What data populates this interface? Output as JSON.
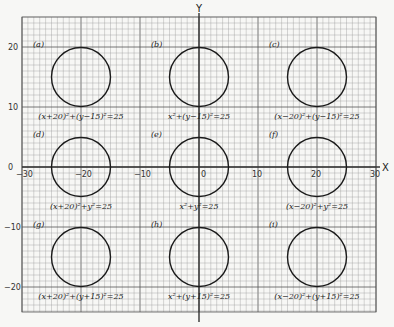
{
  "chart_data": {
    "type": "scatter",
    "title": "",
    "xlabel": "X",
    "ylabel": "Y",
    "xlim": [
      -30,
      30
    ],
    "ylim": [
      -25,
      25
    ],
    "grid": true,
    "x_ticks": [
      "-30",
      "-20",
      "-10",
      "0",
      "10",
      "20",
      "30"
    ],
    "y_ticks": [
      "20",
      "10",
      "0",
      "-10",
      "-20"
    ],
    "circles": [
      {
        "tag": "(a)",
        "cx": -20,
        "cy": 15,
        "r": 5,
        "equation": "(x+20)²+(y−15)²=25"
      },
      {
        "tag": "(b)",
        "cx": 0,
        "cy": 15,
        "r": 5,
        "equation": "x²+(y−15)²=25"
      },
      {
        "tag": "(c)",
        "cx": 20,
        "cy": 15,
        "r": 5,
        "equation": "(x−20)²+(y−15)²=25"
      },
      {
        "tag": "(d)",
        "cx": -20,
        "cy": 0,
        "r": 5,
        "equation": "(x+20)²+y²=25"
      },
      {
        "tag": "(e)",
        "cx": 0,
        "cy": 0,
        "r": 5,
        "equation": "x²+y²=25"
      },
      {
        "tag": "(f)",
        "cx": 20,
        "cy": 0,
        "r": 5,
        "equation": "(x−20)²+y²=25"
      },
      {
        "tag": "(g)",
        "cx": -20,
        "cy": -15,
        "r": 5,
        "equation": "(x+20)²+(y+15)²=25"
      },
      {
        "tag": "(h)",
        "cx": 0,
        "cy": -15,
        "r": 5,
        "equation": "x²+(y+15)²=25"
      },
      {
        "tag": "(i)",
        "cx": 20,
        "cy": -15,
        "r": 5,
        "equation": "(x−20)²+(y+15)²=25"
      }
    ]
  },
  "colors": {
    "grid_minor": "#9a9a9a",
    "grid_major": "#555555",
    "axis": "#333333",
    "circle": "#1a1a1a",
    "paper": "#f7f7f5"
  }
}
